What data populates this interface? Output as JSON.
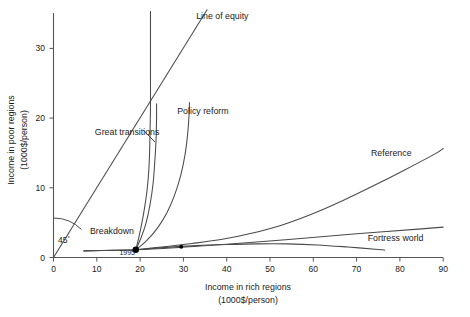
{
  "chart_data": {
    "type": "line",
    "title": "",
    "xlabel": "Income in rich regions",
    "xlabel_units": "(1000$/person)",
    "ylabel": "Income in poor regions",
    "ylabel_units": "(1000$/person)",
    "xlim": [
      0,
      90
    ],
    "ylim": [
      0,
      35
    ],
    "xticks": [
      0,
      10,
      20,
      30,
      40,
      50,
      60,
      70,
      80,
      90
    ],
    "yticks": [
      0,
      10,
      20,
      30
    ],
    "grid": false,
    "legend": "inline-annotations",
    "start_point": {
      "label": "1995",
      "x": 19.0,
      "y": 1.1
    },
    "angle_annotation": {
      "label": "45",
      "degrees_symbol": "°"
    },
    "series": [
      {
        "name": "Line of equity",
        "label": "Line of equity",
        "label_x": 39,
        "label_y": 34.2,
        "points": [
          [
            0,
            0
          ],
          [
            35.5,
            35.5
          ]
        ]
      },
      {
        "name": "Great transitions",
        "label": "Great transitions",
        "label_x": 17.0,
        "label_y": 17.6,
        "points": [
          [
            19.0,
            1.1
          ],
          [
            19.6,
            2.6
          ],
          [
            20.3,
            4.6
          ],
          [
            21.0,
            7.0
          ],
          [
            21.6,
            9.6
          ],
          [
            22.0,
            12.4
          ],
          [
            22.2,
            15.2
          ],
          [
            22.3,
            18.2
          ],
          [
            22.4,
            21.5
          ],
          [
            22.4,
            25.0
          ],
          [
            22.4,
            28.5
          ],
          [
            22.4,
            32.0
          ],
          [
            22.4,
            35.2
          ]
        ]
      },
      {
        "name": "Great transitions secondary",
        "label": "",
        "points": [
          [
            19.0,
            1.1
          ],
          [
            20.2,
            2.8
          ],
          [
            21.4,
            5.0
          ],
          [
            22.3,
            7.6
          ],
          [
            23.0,
            10.6
          ],
          [
            23.4,
            13.8
          ],
          [
            23.7,
            17.0
          ],
          [
            23.8,
            20.0
          ],
          [
            23.8,
            22.0
          ]
        ]
      },
      {
        "name": "Policy reform",
        "label": "Policy reform",
        "label_x": 34.5,
        "label_y": 20.5,
        "points": [
          [
            19.0,
            1.1
          ],
          [
            21.5,
            2.4
          ],
          [
            24.0,
            4.2
          ],
          [
            26.2,
            6.4
          ],
          [
            28.0,
            9.0
          ],
          [
            29.4,
            11.8
          ],
          [
            30.4,
            14.8
          ],
          [
            31.0,
            17.8
          ],
          [
            31.3,
            20.4
          ],
          [
            31.4,
            22.2
          ]
        ]
      },
      {
        "name": "Reference",
        "label": "Reference",
        "label_x": 78,
        "label_y": 14.6,
        "points": [
          [
            19.0,
            1.1
          ],
          [
            25.0,
            1.5
          ],
          [
            32.0,
            2.0
          ],
          [
            39.0,
            2.6
          ],
          [
            46.0,
            3.5
          ],
          [
            53.0,
            4.7
          ],
          [
            60.0,
            6.3
          ],
          [
            67.0,
            8.2
          ],
          [
            74.0,
            10.3
          ],
          [
            81.0,
            12.5
          ],
          [
            88.0,
            14.8
          ],
          [
            90.0,
            15.6
          ]
        ]
      },
      {
        "name": "Fortress world",
        "label": "Fortress world",
        "label_x": 79,
        "label_y": 2.4,
        "points": [
          [
            7.0,
            0.95
          ],
          [
            14.0,
            1.05
          ],
          [
            19.0,
            1.1
          ],
          [
            26.0,
            1.45
          ],
          [
            33.0,
            1.7
          ],
          [
            40.0,
            1.85
          ],
          [
            47.0,
            1.95
          ],
          [
            54.0,
            1.95
          ],
          [
            61.0,
            1.8
          ],
          [
            68.0,
            1.5
          ],
          [
            75.0,
            1.15
          ],
          [
            76.5,
            1.05
          ]
        ]
      },
      {
        "name": "Breakdown",
        "label": "Breakdown",
        "label_x": 13.5,
        "label_y": 3.4,
        "points": [
          [
            7.0,
            0.95
          ],
          [
            12.0,
            1.0
          ],
          [
            19.0,
            1.1
          ],
          [
            28.0,
            1.4
          ],
          [
            40.0,
            1.9
          ],
          [
            55.0,
            2.6
          ],
          [
            70.0,
            3.4
          ],
          [
            85.0,
            4.1
          ],
          [
            90.0,
            4.35
          ]
        ]
      }
    ],
    "markers": [
      {
        "name": "start-1995",
        "x": 19.0,
        "y": 1.1,
        "kind": "filled-circle"
      },
      {
        "name": "breakdown-node",
        "x": 29.5,
        "y": 1.55,
        "kind": "filled-circle-small"
      }
    ]
  }
}
